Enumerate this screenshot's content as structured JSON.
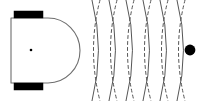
{
  "figure": {
    "title": "Mobile robot emitting wave fronts toward a point object",
    "width": 207,
    "height": 101,
    "background_color": "#ffffff"
  },
  "colors": {
    "outline": "#6e6e6e",
    "wheel_fill": "#000000",
    "body_fill": "#ffffff",
    "wave_stroke": "#555555",
    "target_fill": "#000000",
    "center_dot_fill": "#000000"
  },
  "robot": {
    "label": "robot-body",
    "body": {
      "x": 11,
      "y": 18,
      "width": 56,
      "height": 65,
      "nose_radius": 32,
      "stroke_width": 1.1
    },
    "wheels": [
      {
        "name": "front-left-wheel",
        "x": 14,
        "y": 11,
        "width": 29,
        "height": 7
      },
      {
        "name": "front-right-wheel",
        "x": 14,
        "y": 83,
        "width": 29,
        "height": 7
      }
    ],
    "center_dot": {
      "cx": 31,
      "cy": 50,
      "r": 1.3
    }
  },
  "waves": {
    "label": "emitted-wave-fronts",
    "count": 6,
    "spacing": 17,
    "first_x": 96,
    "center_y": 50,
    "arc_half_height": 50,
    "arc_bulge": 9,
    "stroke_width": 1.0,
    "dash_pattern": "3 3",
    "fronts": [
      {
        "index": 1,
        "x": 96,
        "style": "crest"
      },
      {
        "index": 2,
        "x": 113,
        "style": "crest"
      },
      {
        "index": 3,
        "x": 130,
        "style": "crest"
      },
      {
        "index": 4,
        "x": 147,
        "style": "crest"
      },
      {
        "index": 5,
        "x": 164,
        "style": "crest"
      },
      {
        "index": 6,
        "x": 181,
        "style": "crest"
      }
    ],
    "trough_offset": -8
  },
  "target": {
    "label": "target-object",
    "cx": 190,
    "cy": 50,
    "r": 5.4
  }
}
